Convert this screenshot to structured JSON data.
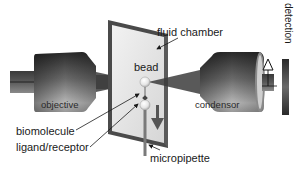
{
  "diagram": {
    "type": "optical-trap-schematic",
    "labels": {
      "fluid_chamber": "fluid chamber",
      "bead": "bead",
      "objective": "objective",
      "condensor": "condensor",
      "biomolecule": "biomolecule",
      "ligand_receptor": "ligand/receptor",
      "micropipette": "micropipette",
      "detection": "detection",
      "delta_symbol": "Δ"
    },
    "components": [
      {
        "id": "objective",
        "label": "objective",
        "position": "left"
      },
      {
        "id": "fluid-chamber",
        "label": "fluid chamber",
        "position": "center"
      },
      {
        "id": "bead",
        "label": "bead",
        "position": "center"
      },
      {
        "id": "biomolecule",
        "label": "biomolecule",
        "position": "center"
      },
      {
        "id": "ligand-receptor",
        "label": "ligand/receptor",
        "position": "center"
      },
      {
        "id": "micropipette",
        "label": "micropipette",
        "position": "center-bottom"
      },
      {
        "id": "condensor",
        "label": "condensor",
        "position": "right"
      },
      {
        "id": "detection",
        "label": "detection",
        "position": "far-right"
      }
    ],
    "arrows": [
      {
        "from": "fluid chamber label",
        "to": "fluid chamber"
      },
      {
        "from": "biomolecule label",
        "to": "biomolecule"
      },
      {
        "from": "ligand/receptor label",
        "to": "ligand/receptor"
      },
      {
        "from": "micropipette label",
        "to": "micropipette"
      },
      {
        "type": "pull-direction",
        "direction": "down"
      },
      {
        "type": "displacement",
        "symbol": "Δ",
        "direction": "up"
      }
    ],
    "colors": {
      "background": "#ffffff",
      "chamber_fill": "#e8e8e8",
      "chamber_border": "#4a4a4a",
      "lens_dark": "#2e2e2e",
      "lens_light": "#bdbdbd",
      "beam": "#3a3a3a",
      "text": "#1a1a1a"
    }
  }
}
